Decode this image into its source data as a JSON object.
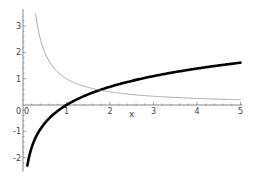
{
  "chart_data": {
    "type": "line",
    "title": "",
    "xlabel": "x",
    "ylabel": "",
    "xlim": [
      0,
      5
    ],
    "ylim": [
      -2.3,
      3.5
    ],
    "grid": false,
    "legend": null,
    "x_ticks": [
      1,
      2,
      3,
      4,
      5
    ],
    "x_tick_labels": [
      "1",
      "2",
      "3",
      "4",
      "5"
    ],
    "y_ticks": [
      -2,
      -1,
      1,
      2,
      3
    ],
    "y_tick_labels": [
      "-2",
      "-1",
      "1",
      "2",
      "3"
    ],
    "origin_label": "0",
    "series": [
      {
        "name": "log(x)",
        "style": "thick",
        "color": "#000000",
        "x": [
          0.1,
          0.2,
          0.3,
          0.5,
          0.75,
          1,
          1.5,
          2,
          2.5,
          3,
          3.5,
          4,
          4.5,
          5
        ],
        "values": [
          -2.3,
          -1.61,
          -1.2,
          -0.69,
          -0.29,
          0,
          0.41,
          0.69,
          0.92,
          1.1,
          1.25,
          1.39,
          1.5,
          1.61
        ]
      },
      {
        "name": "1/x",
        "style": "thin",
        "color": "#888888",
        "x": [
          0.29,
          0.35,
          0.5,
          0.75,
          1,
          1.5,
          2,
          2.5,
          3,
          3.5,
          4,
          4.5,
          5
        ],
        "values": [
          3.45,
          2.86,
          2.0,
          1.33,
          1.0,
          0.67,
          0.5,
          0.4,
          0.33,
          0.29,
          0.25,
          0.22,
          0.2
        ]
      }
    ],
    "annotations": []
  },
  "layout": {
    "origin_px": [
      23,
      105
    ],
    "px_per_x": 43.5,
    "px_per_y": 26.3
  }
}
